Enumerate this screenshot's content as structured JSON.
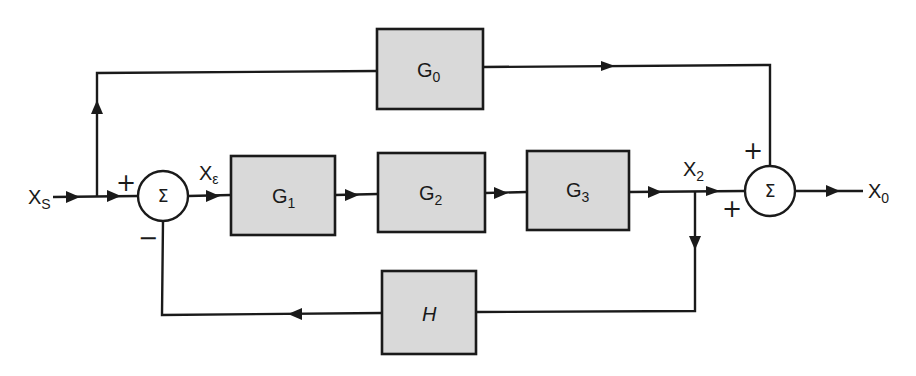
{
  "diagram": {
    "type": "block-diagram",
    "blocks": [
      {
        "id": "G0",
        "name": "G",
        "sub": "0",
        "x": 377,
        "y": 29,
        "w": 106,
        "h": 80
      },
      {
        "id": "G1",
        "name": "G",
        "sub": "1",
        "x": 231,
        "y": 156,
        "w": 104,
        "h": 79
      },
      {
        "id": "G2",
        "name": "G",
        "sub": "2",
        "x": 378,
        "y": 153,
        "w": 107,
        "h": 79
      },
      {
        "id": "G3",
        "name": "G",
        "sub": "3",
        "x": 527,
        "y": 151,
        "w": 102,
        "h": 79
      },
      {
        "id": "H",
        "name": "H",
        "sub": "",
        "x": 382,
        "y": 271,
        "w": 94,
        "h": 83
      }
    ],
    "summing_junctions": [
      {
        "id": "sum1",
        "symbol": "Σ",
        "cx": 163,
        "cy": 196,
        "r": 25,
        "signs": [
          {
            "text": "+",
            "pos": "top-left"
          },
          {
            "text": "−",
            "pos": "bottom-left"
          }
        ]
      },
      {
        "id": "sum2",
        "symbol": "Σ",
        "cx": 770,
        "cy": 191,
        "r": 25,
        "signs": [
          {
            "text": "+",
            "pos": "top-left"
          },
          {
            "text": "+",
            "pos": "bottom-left"
          }
        ]
      }
    ],
    "signals": [
      {
        "id": "Xs",
        "name": "X",
        "sub": "S",
        "desc": "input signal"
      },
      {
        "id": "Xe",
        "name": "X",
        "sub": "ε",
        "desc": "error signal"
      },
      {
        "id": "X2",
        "name": "X",
        "sub": "2",
        "desc": "forward path output"
      },
      {
        "id": "Xo",
        "name": "X",
        "sub": "0",
        "desc": "output signal"
      }
    ],
    "connections": [
      {
        "from": "Xs",
        "to": "sum1",
        "sign": "+"
      },
      {
        "from": "Xs",
        "to": "G0",
        "via": "branch point"
      },
      {
        "from": "sum1",
        "to": "G1",
        "signal": "Xe"
      },
      {
        "from": "G1",
        "to": "G2"
      },
      {
        "from": "G2",
        "to": "G3"
      },
      {
        "from": "G3",
        "to": "sum2",
        "signal": "X2",
        "sign": "+"
      },
      {
        "from": "X2",
        "to": "H",
        "via": "branch point"
      },
      {
        "from": "H",
        "to": "sum1",
        "sign": "−"
      },
      {
        "from": "G0",
        "to": "sum2",
        "sign": "+"
      },
      {
        "from": "sum2",
        "to": "Xo"
      }
    ]
  },
  "labels": {
    "g0_main": "G",
    "g0_sub": "0",
    "g1_main": "G",
    "g1_sub": "1",
    "g2_main": "G",
    "g2_sub": "2",
    "g3_main": "G",
    "g3_sub": "3",
    "h_main": "H",
    "xs_main": "X",
    "xs_sub": "S",
    "xe_main": "X",
    "xe_sub": "ε",
    "x2_main": "X",
    "x2_sub": "2",
    "xo_main": "X",
    "xo_sub": "0",
    "sum1_symbol": "Σ",
    "sum2_symbol": "Σ",
    "sum1_sign_top": "+",
    "sum1_sign_bottom": "−",
    "sum2_sign_top": "+",
    "sum2_sign_bottom": "+"
  }
}
